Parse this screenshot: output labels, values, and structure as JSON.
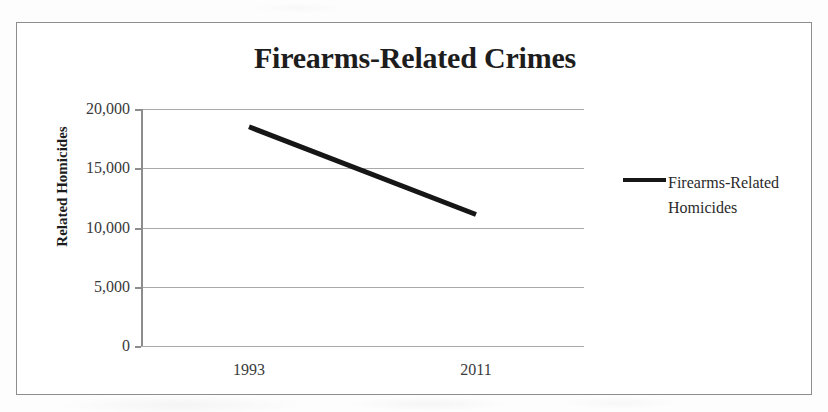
{
  "figure": {
    "border_color": "#8d8d8d",
    "background": "#ffffff"
  },
  "chart_data": {
    "type": "line",
    "title": "Firearms-Related Crimes",
    "xlabel": "",
    "ylabel": "Related Homicides",
    "categories": [
      "1993",
      "2011"
    ],
    "x": [
      "1993",
      "2011"
    ],
    "series": [
      {
        "name": "Firearms-Related Homicides",
        "values": [
          18500,
          11100
        ],
        "color": "#161616",
        "line_width": 5
      }
    ],
    "ylim": [
      0,
      20000
    ],
    "yticks": [
      0,
      5000,
      10000,
      15000,
      20000
    ],
    "ytick_labels": [
      "0",
      "5,000",
      "10,000",
      "15,000",
      "20,000"
    ],
    "grid": true,
    "grid_color": "#a9a9a9",
    "grid_axis": "y",
    "legend": {
      "position": "right",
      "entries": [
        "Firearms-Related Homicides"
      ]
    }
  }
}
